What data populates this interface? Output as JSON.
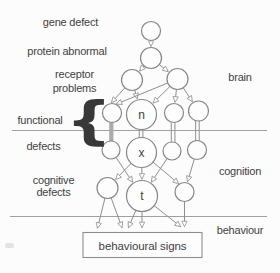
{
  "labels": {
    "gene_defect": "gene defect",
    "protein_abnormal": "protein abnormal",
    "receptor_problems_line1": "receptor",
    "receptor_problems_line2": "problems",
    "brain": "brain",
    "functional": "functional",
    "defects": "defects",
    "cognitive_line1": "cognitive",
    "cognitive_line2": "defects",
    "cognition": "cognition",
    "behaviour": "behaviour",
    "brace": "{"
  },
  "node_letters": {
    "n": "n",
    "x": "x",
    "t": "t"
  },
  "box_label": "behavioural signs",
  "diagram_summary": {
    "levels_right_labels": [
      "brain",
      "cognition",
      "behaviour"
    ],
    "levels_left_labels": [
      "gene defect",
      "protein abnormal",
      "receptor problems",
      "functional defects",
      "cognitive defects"
    ],
    "sink_box": "behavioural signs"
  },
  "colors": {
    "stroke": "#8e8e8e",
    "text": "#3f3f3f",
    "divider": "#a0a0a0",
    "grey_bar": "#ababab",
    "background": "#fcfcfc"
  }
}
